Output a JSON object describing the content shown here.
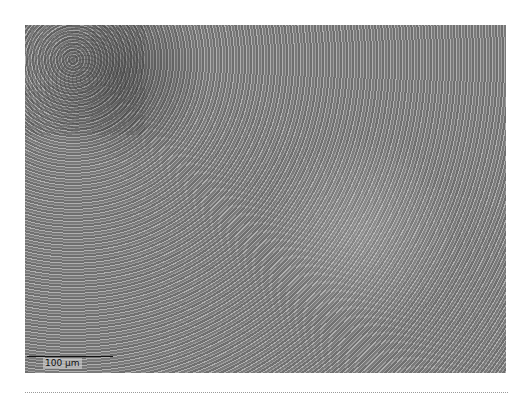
{
  "figure": {
    "scale_bar": {
      "label": "100 µm"
    }
  }
}
